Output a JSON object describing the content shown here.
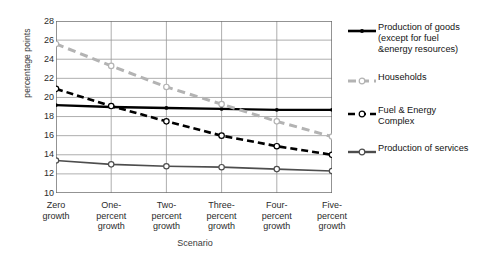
{
  "chart_data": {
    "type": "line",
    "title": "",
    "xlabel": "Scenario",
    "ylabel": "percentage points",
    "categories": [
      "Zero\ngrowth",
      "One-\npercent\ngrowth",
      "Two-\npercent\ngrowth",
      "Three-\npercent\ngrowth",
      "Four-\npercent\ngrowth",
      "Five-\npercent\ngrowth"
    ],
    "ylim": [
      10,
      28
    ],
    "ytick_step": 2,
    "yticks": [
      28,
      26,
      24,
      22,
      20,
      18,
      16,
      14,
      12,
      10
    ],
    "grid": "horizontal-and-vertical",
    "legend_position": "right",
    "series": [
      {
        "name": "Production of goods\n(except for fuel\n&energy resources)",
        "values": [
          19.2,
          19.0,
          18.9,
          18.8,
          18.7,
          18.7
        ],
        "color": "#000000",
        "style": "solid",
        "marker": "dot"
      },
      {
        "name": "Households",
        "values": [
          25.6,
          23.3,
          21.1,
          19.3,
          17.5,
          15.9
        ],
        "color": "#b3b3b3",
        "style": "dashed",
        "marker": "circle"
      },
      {
        "name": "Fuel & Energy\nComplex",
        "values": [
          20.9,
          19.1,
          17.5,
          16.0,
          14.9,
          14.0
        ],
        "color": "#000000",
        "style": "dashed",
        "marker": "circle"
      },
      {
        "name": "Production of services",
        "values": [
          13.4,
          13.0,
          12.8,
          12.7,
          12.5,
          12.3
        ],
        "color": "#4d4d4d",
        "style": "solid",
        "marker": "circle"
      }
    ]
  },
  "legend": {
    "items": [
      {
        "label": "Production of goods\n(except for fuel\n&energy resources)"
      },
      {
        "label": "Households"
      },
      {
        "label": "Fuel & Energy\nComplex"
      },
      {
        "label": "Production of services"
      }
    ]
  }
}
